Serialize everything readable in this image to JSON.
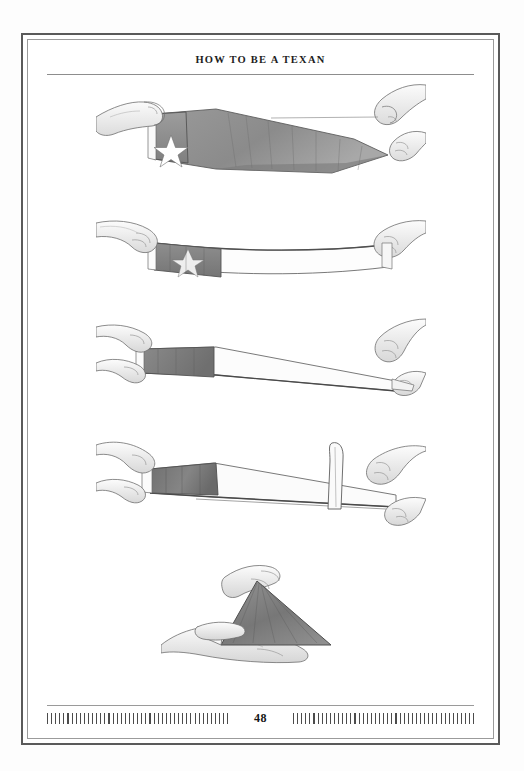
{
  "book": {
    "running_head": "HOW TO BE A TEXAN",
    "folio": "48"
  },
  "figure": {
    "medium": "pencil-illustration",
    "panel_count": 5,
    "panels": [
      {
        "id": "panel-1",
        "name": "flag-held-open",
        "caption": "",
        "alt": "Three hands hold the Texas flag open and stretched horizontally, blue field with white star at left"
      },
      {
        "id": "panel-2",
        "name": "flag-folded-lengthwise-once",
        "caption": "",
        "alt": "Two hands pull the flag taut after folding it in half lengthwise"
      },
      {
        "id": "panel-3",
        "name": "flag-folded-lengthwise-twice",
        "caption": "",
        "alt": "The flag folded lengthwise again into a narrow strip held between two hands"
      },
      {
        "id": "panel-4",
        "name": "triangle-fold-started",
        "caption": "",
        "alt": "A hand lifts the striped end of the folded strip vertically to begin the triangular fold"
      },
      {
        "id": "panel-5",
        "name": "finished-triangle",
        "caption": "",
        "alt": "The finished triangular folded flag resting in an open hand"
      }
    ]
  },
  "style": {
    "page_background": "#ffffff",
    "scan_background": "#fdfdfd",
    "frame_outer_color": "#5a5a5a",
    "frame_inner_color": "#9b9b9b",
    "rule_color": "#8d8d8d",
    "tick_color": "#4c4c4c",
    "ink_color": "#1d1d1d",
    "flag_field_tone": "#8d8d8d",
    "flag_stripe_tone": "#b7b7b7"
  }
}
